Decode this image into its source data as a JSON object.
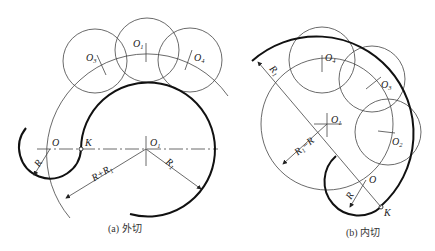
{
  "figures": [
    {
      "id": "a",
      "caption": "(a) 外切",
      "labels": {
        "O": "O",
        "K": "K",
        "O1": "O",
        "O1_sub": "1",
        "O3": "O",
        "O3_sub": "3",
        "O1top": "O",
        "O1top_sub": "1",
        "O4": "O",
        "O4_sub": "4",
        "R": "R",
        "R_plus_R1": "R+R",
        "R_plus_R1_sub": "1",
        "R1": "R",
        "R1_sub": "1"
      }
    },
    {
      "id": "b",
      "caption": "(b) 内切",
      "labels": {
        "O": "O",
        "K": "K",
        "O1": "O",
        "O1_sub": "1",
        "O2": "O",
        "O2_sub": "2",
        "O3": "O",
        "O3_sub": "3",
        "O4": "O",
        "O4_sub": "4",
        "R": "R",
        "R1": "R",
        "R1_sub": "1",
        "R1_minus_R": "R",
        "R1_minus_R_sub": "1",
        "R1_minus_R_tail": "−R"
      }
    }
  ]
}
